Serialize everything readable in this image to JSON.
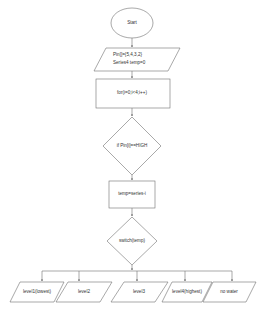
{
  "diagram": {
    "type": "flowchart",
    "colors": {
      "stroke": "#6f6f6f",
      "text": "#333333",
      "background": "#ffffff"
    },
    "nodes": {
      "start": {
        "shape": "ellipse",
        "label": "Start"
      },
      "init": {
        "shape": "parallelogram",
        "line1": "Pin[]={5,4,3,2}",
        "line2": "Series4   temp=0"
      },
      "loop": {
        "shape": "rectangle",
        "label": "for(i=0;i<4;i++)"
      },
      "check": {
        "shape": "diamond",
        "label": "if Pin[i]==HIGH"
      },
      "assign": {
        "shape": "rectangle",
        "label": "temp=series-i"
      },
      "switch": {
        "shape": "diamond",
        "label": "switch(temp)"
      },
      "outputs": [
        {
          "shape": "parallelogram",
          "label": "level1(lowest)"
        },
        {
          "shape": "parallelogram",
          "label": "level2"
        },
        {
          "shape": "parallelogram",
          "label": "level3"
        },
        {
          "shape": "parallelogram",
          "label": "level4(highest)"
        },
        {
          "shape": "parallelogram",
          "label": "no water"
        }
      ]
    },
    "edges": [
      [
        "start",
        "init"
      ],
      [
        "init",
        "loop"
      ],
      [
        "loop",
        "check"
      ],
      [
        "check",
        "assign"
      ],
      [
        "assign",
        "switch"
      ],
      [
        "switch",
        "outputs.0"
      ],
      [
        "switch",
        "outputs.1"
      ],
      [
        "switch",
        "outputs.2"
      ],
      [
        "switch",
        "outputs.3"
      ],
      [
        "switch",
        "outputs.4"
      ]
    ]
  }
}
